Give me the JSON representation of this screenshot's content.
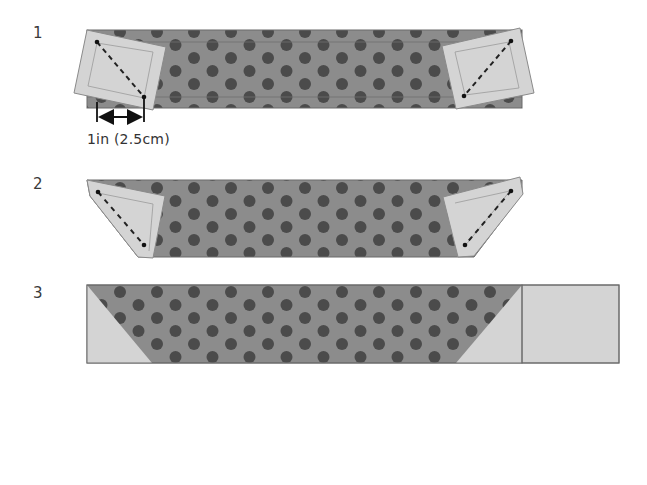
{
  "steps": [
    {
      "number": "1",
      "description": "Square placed at each end of polka-dot strip, diagonal stitch line marked"
    },
    {
      "number": "2",
      "description": "Corners folded over along stitch lines"
    },
    {
      "number": "3",
      "description": "Finished strip with triangle corners and attached square"
    }
  ],
  "dimension": {
    "label": "1in (2.5cm)"
  },
  "colors": {
    "fabric": "#8a8a8a",
    "dot": "#4a4a4a",
    "square": "#d3d3d3",
    "outline": "#666666",
    "stitch": "#222222"
  }
}
